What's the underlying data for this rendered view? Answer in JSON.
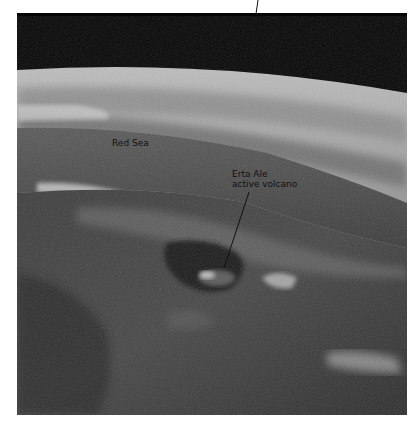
{
  "figure": {
    "labels": {
      "red_sea": "Red Sea",
      "volcano_line1": "Erta Ale",
      "volcano_line2": "active volcano"
    },
    "colors": {
      "space": "#050505",
      "atmosphere": "#9a9a9a",
      "sea": "#4a4a4a",
      "land": "#3a3a3a",
      "leader_line": "#111111"
    }
  }
}
